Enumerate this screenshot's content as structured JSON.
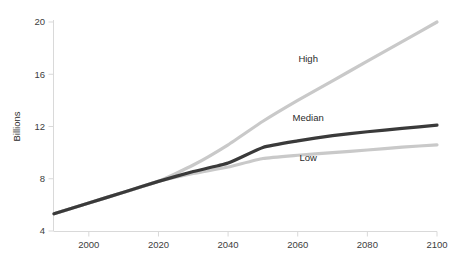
{
  "chart_data": {
    "type": "line",
    "title": "",
    "subtitle": "",
    "xlabel": "",
    "ylabel": "Billions",
    "xlim": [
      1990,
      2100
    ],
    "ylim": [
      4,
      20
    ],
    "grid": false,
    "legend_position": "inline-annotations",
    "x_ticks": [
      "2000",
      "2020",
      "2040",
      "2060",
      "2080",
      "2100"
    ],
    "x_tick_values": [
      2000,
      2020,
      2040,
      2060,
      2080,
      2100
    ],
    "y_ticks": [
      "4",
      "8",
      "12",
      "16",
      "20"
    ],
    "y_tick_values": [
      4,
      8,
      12,
      16,
      20
    ],
    "x": [
      1990,
      2000,
      2010,
      2020,
      2030,
      2040,
      2050,
      2060,
      2070,
      2080,
      2090,
      2100
    ],
    "series": [
      {
        "name": "High",
        "color": "#c9c9c9",
        "values": [
          5.32,
          6.15,
          6.96,
          7.8,
          9.05,
          10.6,
          12.4,
          14.0,
          15.5,
          17.0,
          18.5,
          20.0
        ],
        "label": "High",
        "label_x": 2063,
        "label_y": 16.9
      },
      {
        "name": "Median",
        "color": "#3a3a3a",
        "values": [
          5.32,
          6.15,
          6.96,
          7.8,
          8.55,
          9.2,
          10.4,
          10.9,
          11.3,
          11.6,
          11.85,
          12.1
        ],
        "label": "Median",
        "label_x": 2063,
        "label_y": 12.4
      },
      {
        "name": "Low",
        "color": "#c9c9c9",
        "values": [
          5.32,
          6.15,
          6.96,
          7.8,
          8.4,
          8.9,
          9.55,
          9.8,
          10.0,
          10.2,
          10.42,
          10.6
        ],
        "label": "Low",
        "label_x": 2063,
        "label_y": 9.35
      }
    ]
  }
}
